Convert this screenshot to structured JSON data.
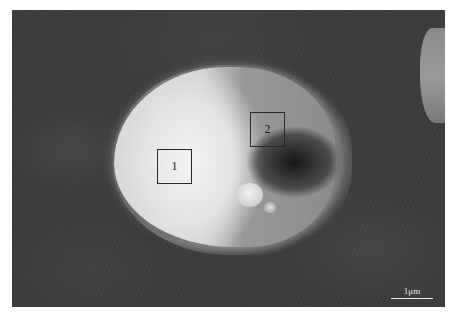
{
  "image": {
    "type": "SEM micrograph",
    "description": "Rounded particle with bright left region and darker right shell",
    "background_color": "#3c3c3c"
  },
  "regions": [
    {
      "label": "1",
      "description": "bright region box"
    },
    {
      "label": "2",
      "description": "darker region box"
    }
  ],
  "scale_bar": {
    "label": "1μm"
  }
}
